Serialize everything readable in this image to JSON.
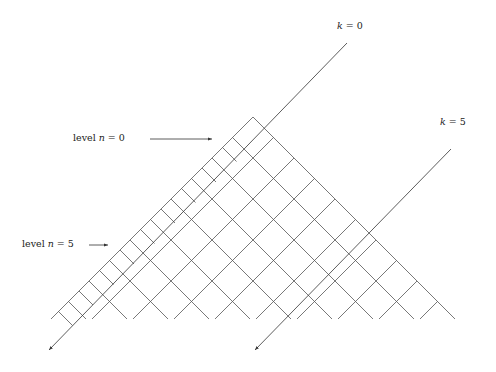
{
  "diagram": {
    "title": "",
    "labels": {
      "k0": {
        "var": "k",
        "eq": " = 0",
        "x": 337,
        "y": 20
      },
      "k5": {
        "var": "k",
        "eq": " = 5",
        "x": 440,
        "y": 116
      },
      "level0": {
        "pre": "level ",
        "var": "n",
        "eq": " = 0",
        "x": 73,
        "y": 132
      },
      "level5": {
        "pre": "level ",
        "var": "n",
        "eq": " = 5",
        "x": 22,
        "y": 238
      }
    },
    "arrows": [
      {
        "name": "level-0-arrow",
        "x1": 150,
        "y1": 139,
        "x2": 212,
        "y2": 139
      },
      {
        "name": "level-5-arrow",
        "x1": 89,
        "y1": 245,
        "x2": 108,
        "y2": 245
      }
    ],
    "lattice": {
      "apex": [
        253,
        117
      ],
      "bottom_y": 319,
      "color": "#555555"
    },
    "k_lines": [
      {
        "name": "k-0-line",
        "top": [
          347,
          43
        ],
        "bottom": [
          49,
          350
        ]
      },
      {
        "name": "k-5-line",
        "top": [
          451,
          149
        ],
        "bottom": [
          255,
          350
        ]
      }
    ]
  }
}
